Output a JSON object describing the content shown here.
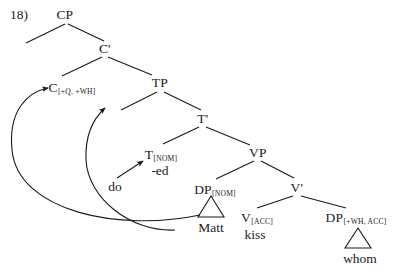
{
  "figure": {
    "number_label": "18)",
    "type": "syntax-tree-diagram"
  },
  "nodes": {
    "cp": {
      "category": "CP",
      "subscript": "",
      "x": 65,
      "y": 8
    },
    "cbar": {
      "category": "C'",
      "subscript": "",
      "x": 105,
      "y": 42
    },
    "c": {
      "category": "C",
      "subscript": "[+Q, +WH]",
      "x": 72,
      "y": 81
    },
    "tp": {
      "category": "TP",
      "subscript": "",
      "x": 160,
      "y": 76
    },
    "tbar": {
      "category": "T'",
      "subscript": "",
      "x": 203,
      "y": 112
    },
    "t": {
      "category": "T",
      "subscript": "[NOM]",
      "x": 161,
      "y": 148
    },
    "vp": {
      "category": "VP",
      "subscript": "",
      "x": 258,
      "y": 146
    },
    "dp_subj": {
      "category": "DP",
      "subscript": "[NOM]",
      "x": 215,
      "y": 183
    },
    "vbar": {
      "category": "V'",
      "subscript": "",
      "x": 297,
      "y": 181
    },
    "v": {
      "category": "V",
      "subscript": "[ACC]",
      "x": 257,
      "y": 211
    },
    "dp_obj": {
      "category": "DP",
      "subscript": "[+WH, ACC]",
      "x": 356,
      "y": 211
    }
  },
  "words": {
    "ed": {
      "text": "-ed",
      "x": 160,
      "y": 164
    },
    "do": {
      "text": "do",
      "x": 115,
      "y": 180
    },
    "matt": {
      "text": "Matt",
      "x": 211,
      "y": 221
    },
    "kiss": {
      "text": "kiss",
      "x": 255,
      "y": 228
    },
    "whom": {
      "text": "whom",
      "x": 360,
      "y": 252
    }
  },
  "movement_arrows": [
    {
      "name": "wh-movement-whom-to-spec-cp",
      "from": "DP[+WH, ACC] (whom)",
      "to": "C[+Q, +WH]",
      "path": "M 200 215 C 120 232 18 212 12 150 C 8 110 28 92 48 88"
    },
    {
      "name": "t-to-c-movement",
      "from": "T[NOM]",
      "to": "TP",
      "path": "M 175 230 C 130 232 88 198 86 160 C 85 135 94 118 105 108"
    },
    {
      "name": "do-support-insertion",
      "from": "do",
      "to": "T[NOM]",
      "path": "M 117 178 L 143 161"
    }
  ],
  "branches": [
    {
      "name": "cp-to-left-daughter",
      "x1": 65,
      "y1": 24,
      "x2": 26,
      "y2": 43
    },
    {
      "name": "cp-to-cbar",
      "x1": 68,
      "y1": 24,
      "x2": 104,
      "y2": 41
    },
    {
      "name": "cbar-to-c",
      "x1": 102,
      "y1": 57,
      "x2": 62,
      "y2": 76
    },
    {
      "name": "cbar-to-tp",
      "x1": 108,
      "y1": 57,
      "x2": 152,
      "y2": 75
    },
    {
      "name": "tp-to-left-daughter",
      "x1": 157,
      "y1": 92,
      "x2": 121,
      "y2": 110
    },
    {
      "name": "tp-to-tbar",
      "x1": 164,
      "y1": 92,
      "x2": 201,
      "y2": 110
    },
    {
      "name": "tbar-to-t",
      "x1": 199,
      "y1": 127,
      "x2": 163,
      "y2": 144
    },
    {
      "name": "tbar-to-vp",
      "x1": 206,
      "y1": 127,
      "x2": 250,
      "y2": 145
    },
    {
      "name": "vp-to-dp-subject",
      "x1": 254,
      "y1": 161,
      "x2": 216,
      "y2": 179
    },
    {
      "name": "vp-to-vbar",
      "x1": 261,
      "y1": 161,
      "x2": 294,
      "y2": 178
    },
    {
      "name": "vbar-to-v",
      "x1": 293,
      "y1": 196,
      "x2": 257,
      "y2": 208
    },
    {
      "name": "vbar-to-dp-object",
      "x1": 301,
      "y1": 196,
      "x2": 346,
      "y2": 208
    }
  ],
  "triangles": [
    {
      "name": "triangle-matt",
      "cx": 211,
      "apex_y": 196,
      "base_y": 217,
      "half_width": 13
    },
    {
      "name": "triangle-whom",
      "cx": 358,
      "apex_y": 228,
      "base_y": 248,
      "half_width": 13
    }
  ],
  "style": {
    "line_color": "#1a1a1a",
    "text_color": "#1a1a1a",
    "background": "#ffffff"
  }
}
